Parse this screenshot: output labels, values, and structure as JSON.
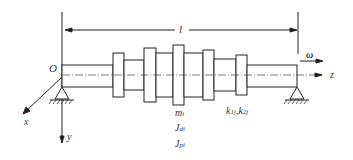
{
  "diagram": {
    "labels": {
      "origin": "O",
      "length": "l",
      "omega": "ω",
      "z_axis": "z",
      "x_axis": "x",
      "y_axis": "y",
      "mass": "m",
      "mass_sub": "i",
      "jd": "J",
      "jd_sub": "di",
      "jp": "J",
      "jp_sub": "pi",
      "k1": "k",
      "k1_sub": "1j",
      "sep": ",",
      "k2": "k",
      "k2_sub": "2j"
    },
    "colors": {
      "line": "#222222",
      "background": "#ffffff"
    }
  }
}
